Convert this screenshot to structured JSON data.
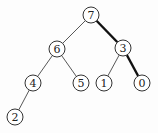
{
  "diagram": {
    "type": "binary-tree",
    "node_radius": 8,
    "nodes": [
      {
        "id": "n7",
        "label": "7",
        "x": 91,
        "y": 15
      },
      {
        "id": "n6",
        "label": "6",
        "x": 57,
        "y": 49
      },
      {
        "id": "n3",
        "label": "3",
        "x": 123,
        "y": 48
      },
      {
        "id": "n4",
        "label": "4",
        "x": 33,
        "y": 83
      },
      {
        "id": "n5",
        "label": "5",
        "x": 81,
        "y": 83
      },
      {
        "id": "n1",
        "label": "1",
        "x": 104,
        "y": 83
      },
      {
        "id": "n0",
        "label": "0",
        "x": 142,
        "y": 83
      },
      {
        "id": "n2",
        "label": "2",
        "x": 15,
        "y": 117
      }
    ],
    "edges": [
      {
        "from": "n7",
        "to": "n6",
        "bold": false
      },
      {
        "from": "n7",
        "to": "n3",
        "bold": true
      },
      {
        "from": "n6",
        "to": "n4",
        "bold": false
      },
      {
        "from": "n6",
        "to": "n5",
        "bold": false
      },
      {
        "from": "n3",
        "to": "n1",
        "bold": false
      },
      {
        "from": "n3",
        "to": "n0",
        "bold": true
      },
      {
        "from": "n4",
        "to": "n2",
        "bold": false
      }
    ],
    "highlighted_path": [
      "7",
      "3",
      "0"
    ]
  }
}
